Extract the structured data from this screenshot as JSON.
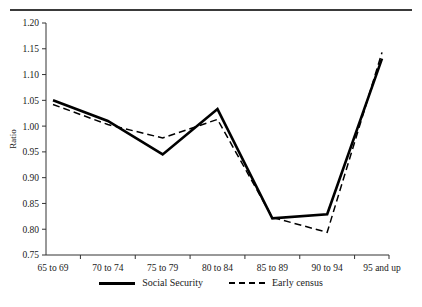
{
  "chart_data": {
    "type": "line",
    "title": "",
    "xlabel": "",
    "ylabel": "Ratio",
    "categories": [
      "65 to 69",
      "70 to 74",
      "75 to 79",
      "80 to 84",
      "85 to 89",
      "90 to 94",
      "95 and up"
    ],
    "ylim": [
      0.75,
      1.2
    ],
    "ytick_step": 0.05,
    "ytick_labels": [
      "0.75",
      "0.80",
      "0.85",
      "0.90",
      "0.95",
      "1.00",
      "1.05",
      "1.10",
      "1.15",
      "1.20"
    ],
    "ytick_values": [
      0.75,
      0.8,
      0.85,
      0.9,
      0.95,
      1.0,
      1.05,
      1.1,
      1.15,
      1.2
    ],
    "grid": false,
    "legend_position": "bottom-center",
    "series": [
      {
        "name": "Social Security",
        "style": "solid",
        "color": "#000000",
        "values": [
          1.05,
          1.01,
          0.945,
          1.033,
          0.821,
          0.829,
          1.131
        ]
      },
      {
        "name": "Early census",
        "style": "dashed",
        "color": "#000000",
        "values": [
          1.042,
          1.003,
          0.977,
          1.013,
          0.823,
          0.794,
          1.143
        ]
      }
    ]
  },
  "legend": {
    "entries": [
      {
        "label": "Social Security",
        "key": "solid-line-key"
      },
      {
        "label": "Early census",
        "key": "dashed-line-key"
      }
    ]
  },
  "axes": {
    "y_axis_title": "Ratio"
  }
}
